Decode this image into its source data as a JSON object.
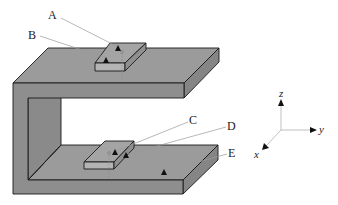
{
  "figure": {
    "labels": {
      "A": "A",
      "B": "B",
      "C": "C",
      "D": "D",
      "E": "E"
    },
    "axes": {
      "x": "x",
      "y": "y",
      "z": "z"
    },
    "colors": {
      "face_top": "#9a9a9a",
      "face_front": "#8c8c8c",
      "face_side": "#7e7e7e",
      "block_top": "#a3a3a3",
      "block_front": "#b0b0b0",
      "outline": "#1a1a1a",
      "leader": "#9a9a9a"
    }
  }
}
